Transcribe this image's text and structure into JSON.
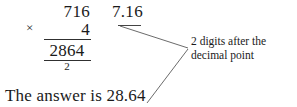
{
  "worked_example": {
    "vertical_multiplication": {
      "multiplicand": "716",
      "operator": "×",
      "multiplier": "4",
      "product": "2864",
      "carry_digit": "2"
    },
    "decimal_factor": "7.16",
    "annotation": "2 digits after the decimal point",
    "annotation_line_1": "2 digits after the",
    "annotation_line_2": "decimal point",
    "conclusion": "The answer is 28.64"
  },
  "style": {
    "ink_color": "#1a1a1a",
    "rule_color": "#303030",
    "leader_color": "#5a5a5a",
    "page_background": "#ffffff"
  }
}
